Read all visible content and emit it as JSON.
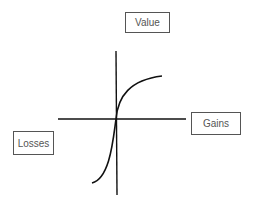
{
  "diagram": {
    "type": "value-function",
    "labels": {
      "y_axis": "Value",
      "x_positive": "Gains",
      "x_negative": "Losses"
    },
    "colors": {
      "axes": "#111111",
      "curve": "#111111",
      "label_border": "#555555",
      "label_text": "#555555",
      "background": "#ffffff"
    }
  }
}
